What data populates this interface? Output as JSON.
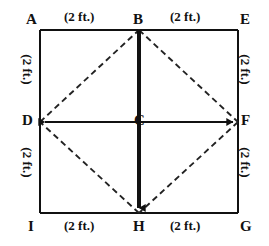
{
  "figure": {
    "type": "geometry-diagram",
    "square": {
      "corners": [
        "A",
        "E",
        "G",
        "I"
      ],
      "side_length_ft": 4,
      "half_side_ft": 2
    },
    "vertices": [
      {
        "id": "A",
        "label": "A",
        "x": 40,
        "y": 30,
        "label_x": 26,
        "label_y": 12,
        "role": "top-left-corner"
      },
      {
        "id": "B",
        "label": "B",
        "x": 139,
        "y": 30,
        "label_x": 133,
        "label_y": 12,
        "role": "top-midpoint"
      },
      {
        "id": "E",
        "label": "E",
        "x": 238,
        "y": 30,
        "label_x": 240,
        "label_y": 12,
        "role": "top-right-corner"
      },
      {
        "id": "D",
        "label": "D",
        "x": 40,
        "y": 122,
        "label_x": 22,
        "label_y": 113,
        "role": "left-midpoint"
      },
      {
        "id": "C",
        "label": "C",
        "x": 139,
        "y": 122,
        "label_x": 134,
        "label_y": 113,
        "role": "center"
      },
      {
        "id": "F",
        "label": "F",
        "x": 238,
        "y": 122,
        "label_x": 241,
        "label_y": 113,
        "role": "right-midpoint"
      },
      {
        "id": "I",
        "label": "I",
        "x": 40,
        "y": 213,
        "label_x": 28,
        "label_y": 219,
        "role": "bottom-left-corner"
      },
      {
        "id": "H",
        "label": "H",
        "x": 139,
        "y": 213,
        "label_x": 133,
        "label_y": 219,
        "role": "bottom-midpoint"
      },
      {
        "id": "G",
        "label": "G",
        "x": 238,
        "y": 213,
        "label_x": 240,
        "label_y": 219,
        "role": "bottom-right-corner"
      }
    ],
    "dimension_labels": [
      {
        "id": "dim-top-left",
        "text": "(2 ft.)",
        "segment": "A-B",
        "x": 64,
        "y": 10,
        "rotated": false
      },
      {
        "id": "dim-top-right",
        "text": "(2 ft.)",
        "segment": "B-E",
        "x": 170,
        "y": 10,
        "rotated": false
      },
      {
        "id": "dim-left-upper",
        "text": "(2 ft.)",
        "segment": "A-D",
        "x": 17,
        "y": 52,
        "rotated": true
      },
      {
        "id": "dim-left-lower",
        "text": "(2 ft.)",
        "segment": "D-I",
        "x": 17,
        "y": 145,
        "rotated": true
      },
      {
        "id": "dim-right-upper",
        "text": "(2 ft.)",
        "segment": "E-F",
        "x": 239,
        "y": 52,
        "rotated": true
      },
      {
        "id": "dim-right-lower",
        "text": "(2 ft.)",
        "segment": "F-G",
        "x": 239,
        "y": 145,
        "rotated": true
      },
      {
        "id": "dim-bottom-left",
        "text": "(2 ft.)",
        "segment": "I-H",
        "x": 64,
        "y": 219,
        "rotated": false
      },
      {
        "id": "dim-bottom-right",
        "text": "(2 ft.)",
        "segment": "H-G",
        "x": 170,
        "y": 219,
        "rotated": false
      }
    ],
    "solid_lines": [
      {
        "id": "edge-top",
        "from": "A",
        "to": "E"
      },
      {
        "id": "edge-right",
        "from": "E",
        "to": "G"
      },
      {
        "id": "edge-bottom",
        "from": "G",
        "to": "I"
      },
      {
        "id": "edge-left",
        "from": "I",
        "to": "A"
      },
      {
        "id": "axis-vertical",
        "from": "B",
        "to": "H",
        "arrow_end": true,
        "weight": "heavy"
      },
      {
        "id": "axis-horizontal",
        "from": "D",
        "to": "F",
        "arrow_start": true,
        "arrow_end": true,
        "weight": "normal"
      }
    ],
    "dashed_lines": [
      {
        "id": "diagonal-DB",
        "from": "D",
        "to": "B"
      },
      {
        "id": "diagonal-BF",
        "from": "B",
        "to": "F"
      },
      {
        "id": "diagonal-FH",
        "from": "F",
        "to": "H"
      },
      {
        "id": "diagonal-HD",
        "from": "H",
        "to": "D"
      }
    ],
    "colors": {
      "stroke": "#111111",
      "background": "#ffffff",
      "dashed_stroke": "#333333"
    }
  }
}
